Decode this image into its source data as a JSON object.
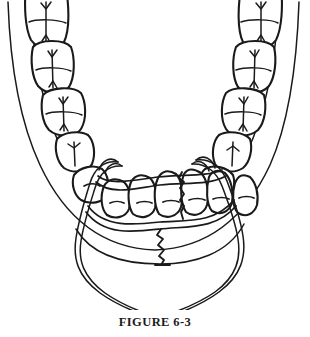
{
  "figure": {
    "caption": "FIGURE 6-3",
    "view": "occlusal-view-of-mandible",
    "background_color": "#ffffff",
    "ink_color": "#1a1a1a"
  },
  "anatomy": {
    "mandible_label": "mandible-outline",
    "left_posterior_teeth": [
      {
        "name": "third-molar",
        "fissure": "cross"
      },
      {
        "name": "second-molar",
        "fissure": "cross"
      },
      {
        "name": "first-molar",
        "fissure": "cross"
      },
      {
        "name": "second-premolar",
        "fissure": "single-groove"
      },
      {
        "name": "first-premolar",
        "fissure": "single-groove"
      }
    ],
    "right_posterior_teeth": [
      {
        "name": "third-molar",
        "fissure": "cross"
      },
      {
        "name": "second-molar",
        "fissure": "cross"
      },
      {
        "name": "first-molar",
        "fissure": "cross"
      },
      {
        "name": "second-premolar",
        "fissure": "single-groove"
      },
      {
        "name": "first-premolar",
        "fissure": "single-groove"
      }
    ],
    "anterior_teeth": [
      {
        "name": "canine-left",
        "mark": "dash"
      },
      {
        "name": "lateral-incisor-left",
        "mark": "dash"
      },
      {
        "name": "central-incisor-left",
        "mark": "dash"
      },
      {
        "name": "central-incisor-right",
        "mark": "dash"
      },
      {
        "name": "lateral-incisor-right",
        "mark": "dash"
      },
      {
        "name": "canine-right",
        "mark": "dash"
      }
    ]
  },
  "appliance": {
    "name": "circumferential-wire",
    "description": "double-strand wire passed around mandible and crossed inferiorly",
    "strand_count": 2,
    "crossing_point": {
      "x": 158,
      "y": 292
    }
  },
  "fracture": {
    "name": "symphysis-fracture",
    "pattern": "zigzag",
    "location": "midline-between-central-incisors"
  }
}
